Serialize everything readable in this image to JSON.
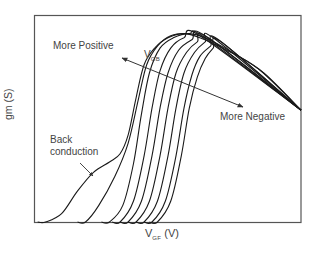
{
  "chart_data": {
    "type": "line",
    "title": "",
    "xlabel": "V_GF (V)",
    "xlabel_main": "V",
    "xlabel_sub": "GF",
    "xlabel_unit": "(V)",
    "ylabel": "gm (S)",
    "grid": false,
    "legend": null,
    "axis_ticks": "none",
    "x_units": "normalized 0-1 across plot width",
    "y_units": "normalized 0-1 across plot height",
    "series": [
      {
        "name": "curve-1 (most positive V_GB, back conduction)",
        "onset_x": 0.04,
        "points": [
          [
            0.04,
            0.0
          ],
          [
            0.1,
            0.04
          ],
          [
            0.16,
            0.15
          ],
          [
            0.22,
            0.24
          ],
          [
            0.28,
            0.29
          ],
          [
            0.32,
            0.33
          ],
          [
            0.35,
            0.42
          ],
          [
            0.38,
            0.6
          ],
          [
            0.41,
            0.76
          ],
          [
            0.45,
            0.84
          ],
          [
            0.5,
            0.89
          ],
          [
            0.56,
            0.91
          ],
          [
            0.62,
            0.89
          ],
          [
            0.72,
            0.83
          ],
          [
            0.84,
            0.74
          ],
          [
            1.0,
            0.54
          ]
        ]
      },
      {
        "name": "curve-2",
        "onset_x": 0.19,
        "points": [
          [
            0.19,
            0.0
          ],
          [
            0.24,
            0.08
          ],
          [
            0.3,
            0.22
          ],
          [
            0.35,
            0.38
          ],
          [
            0.39,
            0.6
          ],
          [
            0.42,
            0.76
          ],
          [
            0.46,
            0.85
          ],
          [
            0.51,
            0.9
          ],
          [
            0.58,
            0.91
          ],
          [
            0.64,
            0.89
          ],
          [
            0.74,
            0.82
          ],
          [
            0.86,
            0.72
          ],
          [
            1.0,
            0.54
          ]
        ]
      },
      {
        "name": "curve-3",
        "onset_x": 0.28,
        "points": [
          [
            0.28,
            0.0
          ],
          [
            0.33,
            0.08
          ],
          [
            0.37,
            0.28
          ],
          [
            0.4,
            0.52
          ],
          [
            0.43,
            0.72
          ],
          [
            0.47,
            0.84
          ],
          [
            0.52,
            0.89
          ],
          [
            0.58,
            0.91
          ],
          [
            0.64,
            0.89
          ],
          [
            1.0,
            0.54
          ]
        ]
      },
      {
        "name": "curve-4",
        "onset_x": 0.32,
        "points": [
          [
            0.32,
            0.0
          ],
          [
            0.37,
            0.1
          ],
          [
            0.41,
            0.32
          ],
          [
            0.44,
            0.55
          ],
          [
            0.47,
            0.73
          ],
          [
            0.51,
            0.84
          ],
          [
            0.56,
            0.89
          ],
          [
            0.62,
            0.9
          ],
          [
            1.0,
            0.54
          ]
        ]
      },
      {
        "name": "curve-5",
        "onset_x": 0.35,
        "points": [
          [
            0.35,
            0.0
          ],
          [
            0.4,
            0.1
          ],
          [
            0.44,
            0.32
          ],
          [
            0.47,
            0.55
          ],
          [
            0.5,
            0.72
          ],
          [
            0.54,
            0.83
          ],
          [
            0.59,
            0.88
          ],
          [
            0.64,
            0.9
          ],
          [
            1.0,
            0.54
          ]
        ]
      },
      {
        "name": "curve-6",
        "onset_x": 0.38,
        "points": [
          [
            0.38,
            0.0
          ],
          [
            0.43,
            0.1
          ],
          [
            0.47,
            0.32
          ],
          [
            0.5,
            0.55
          ],
          [
            0.53,
            0.72
          ],
          [
            0.57,
            0.82
          ],
          [
            0.61,
            0.87
          ],
          [
            0.65,
            0.89
          ],
          [
            1.0,
            0.54
          ]
        ]
      },
      {
        "name": "curve-7",
        "onset_x": 0.41,
        "points": [
          [
            0.41,
            0.0
          ],
          [
            0.46,
            0.1
          ],
          [
            0.5,
            0.32
          ],
          [
            0.53,
            0.55
          ],
          [
            0.56,
            0.72
          ],
          [
            0.6,
            0.82
          ],
          [
            0.64,
            0.87
          ],
          [
            0.67,
            0.89
          ],
          [
            1.0,
            0.54
          ]
        ]
      },
      {
        "name": "curve-8",
        "onset_x": 0.44,
        "points": [
          [
            0.44,
            0.0
          ],
          [
            0.49,
            0.1
          ],
          [
            0.53,
            0.32
          ],
          [
            0.56,
            0.55
          ],
          [
            0.59,
            0.71
          ],
          [
            0.62,
            0.8
          ],
          [
            0.66,
            0.85
          ],
          [
            0.69,
            0.88
          ],
          [
            1.0,
            0.54
          ]
        ]
      },
      {
        "name": "curve-9 (most negative V_GB)",
        "onset_x": 0.46,
        "points": [
          [
            0.46,
            0.0
          ],
          [
            0.51,
            0.1
          ],
          [
            0.55,
            0.32
          ],
          [
            0.58,
            0.55
          ],
          [
            0.61,
            0.7
          ],
          [
            0.64,
            0.79
          ],
          [
            0.67,
            0.84
          ],
          [
            0.7,
            0.87
          ],
          [
            1.0,
            0.54
          ]
        ]
      }
    ],
    "annotations": [
      {
        "text": "More Positive",
        "position": "upper-left"
      },
      {
        "text": "V_GB",
        "main": "V",
        "sub": "GB",
        "position": "near arrow, upper-middle"
      },
      {
        "text": "More Negative",
        "position": "right-middle"
      },
      {
        "text": "Back conduction",
        "line1": "Back",
        "line2": "conduction",
        "position": "lower-left",
        "arrow_to": "curve-1 shoulder"
      }
    ],
    "arrow": {
      "description": "double-headed diagonal arrow from upper-left to lower-right across curves indicating V_GB direction"
    }
  },
  "plot": {
    "frame_color": "#555555",
    "curve_color": "#1a1a1a",
    "background": "#ffffff"
  }
}
